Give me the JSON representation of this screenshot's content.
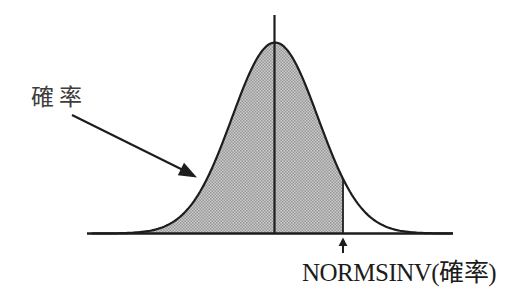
{
  "figure": {
    "type": "normal-distribution-diagram",
    "probability_label": "確率",
    "normsinv_label": "NORMSINV(確率)"
  },
  "colors": {
    "background": "#ffffff",
    "line": "#1d1d1d",
    "shade_light": "#cbcbcb",
    "shade_dark": "#989898"
  },
  "geometry_notes": {
    "shaded_region": "area under bell curve from left tail to the NORMSINV boundary line"
  }
}
